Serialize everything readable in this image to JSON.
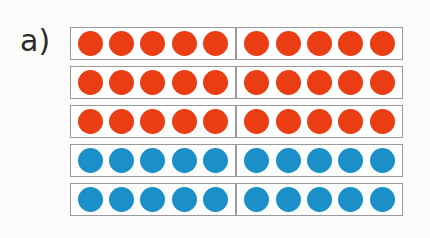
{
  "figure": {
    "part_label": "a)",
    "type": "counting-bars",
    "rows_count": 5,
    "counters_per_row": 10,
    "counters_per_half": 5,
    "halves_per_row": 2,
    "colors": {
      "red": "#ea3d14",
      "blue": "#1a8fc8",
      "frame_border": "#9a9a9a",
      "frame_fill": "#ffffff",
      "background": "#fbfbfa",
      "label_text": "#2b2b2b"
    },
    "totals": {
      "red_counters": 30,
      "blue_counters": 20,
      "all_counters": 50
    },
    "rows": [
      {
        "index": 1,
        "color": "red",
        "count": 10,
        "halves": [
          {
            "side": "left",
            "count": 5,
            "color": "red"
          },
          {
            "side": "right",
            "count": 5,
            "color": "red"
          }
        ]
      },
      {
        "index": 2,
        "color": "red",
        "count": 10,
        "halves": [
          {
            "side": "left",
            "count": 5,
            "color": "red"
          },
          {
            "side": "right",
            "count": 5,
            "color": "red"
          }
        ]
      },
      {
        "index": 3,
        "color": "red",
        "count": 10,
        "halves": [
          {
            "side": "left",
            "count": 5,
            "color": "red"
          },
          {
            "side": "right",
            "count": 5,
            "color": "red"
          }
        ]
      },
      {
        "index": 4,
        "color": "blue",
        "count": 10,
        "halves": [
          {
            "side": "left",
            "count": 5,
            "color": "blue"
          },
          {
            "side": "right",
            "count": 5,
            "color": "blue"
          }
        ]
      },
      {
        "index": 5,
        "color": "blue",
        "count": 10,
        "halves": [
          {
            "side": "left",
            "count": 5,
            "color": "blue"
          },
          {
            "side": "right",
            "count": 5,
            "color": "blue"
          }
        ]
      }
    ]
  }
}
